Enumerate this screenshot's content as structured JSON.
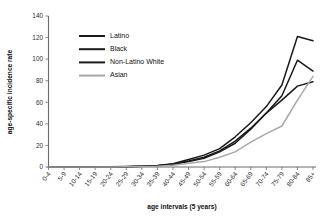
{
  "chart_data": {
    "type": "line",
    "title": "",
    "xlabel": "age intervals (5 years)",
    "ylabel": "age-specific incidence rate",
    "categories": [
      "0-4",
      "5-9",
      "10-14",
      "15-19",
      "20-24",
      "25-29",
      "30-34",
      "35-39",
      "40-44",
      "45-49",
      "50-54",
      "55-59",
      "60-64",
      "65-69",
      "70-74",
      "75-79",
      "80-84",
      "85+"
    ],
    "ylim": [
      0,
      140
    ],
    "yticks": [
      0,
      20,
      40,
      60,
      80,
      100,
      120,
      140
    ],
    "grid": false,
    "legend_position": "upper-left",
    "series": [
      {
        "name": "Latino",
        "color": "#1a1a1a",
        "width": 1.5,
        "values": [
          0,
          0,
          0,
          0,
          0.2,
          0.4,
          0.8,
          1.5,
          3,
          7,
          11,
          17,
          28,
          41,
          56,
          76,
          121,
          117
        ]
      },
      {
        "name": "Black",
        "color": "#1a1a1a",
        "width": 1.5,
        "values": [
          0,
          0,
          0,
          0,
          0.2,
          0.3,
          0.6,
          1.2,
          2.5,
          5,
          8,
          14,
          22,
          35,
          50,
          66,
          99,
          89
        ]
      },
      {
        "name": "Non-Latino White",
        "color": "#1a1a1a",
        "width": 1.5,
        "values": [
          0,
          0,
          0,
          0,
          0.2,
          0.3,
          0.6,
          1.2,
          2.6,
          5.5,
          9,
          15,
          24,
          36,
          50,
          62,
          75,
          79
        ]
      },
      {
        "name": "Asian",
        "color": "#a8a8a8",
        "width": 1.5,
        "values": [
          0,
          0,
          0,
          0,
          0.1,
          0.2,
          0.4,
          0.8,
          1.6,
          3.5,
          5,
          9,
          14,
          23,
          31,
          38,
          62,
          84
        ]
      }
    ]
  },
  "axes": {
    "x_title": "age intervals (5 years)",
    "y_title": "age-specific incidence rate"
  },
  "legend": {
    "entries": [
      {
        "label": "Latino"
      },
      {
        "label": "Black"
      },
      {
        "label": "Non-Latino White"
      },
      {
        "label": "Asian"
      }
    ]
  }
}
